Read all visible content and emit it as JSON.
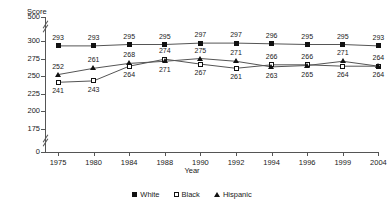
{
  "chart_data": {
    "type": "line",
    "title": "",
    "xlabel": "Year",
    "ylabel": "Score",
    "categories": [
      "1975",
      "1980",
      "1984",
      "1988",
      "1990",
      "1992",
      "1994",
      "1996",
      "1999",
      "2004"
    ],
    "series": [
      {
        "name": "White",
        "marker": "filled-square",
        "values": [
          293,
          293,
          295,
          295,
          297,
          297,
          296,
          295,
          295,
          293
        ]
      },
      {
        "name": "Black",
        "marker": "open-square",
        "values": [
          241,
          243,
          264,
          274,
          267,
          261,
          266,
          266,
          264,
          264
        ]
      },
      {
        "name": "Hispanic",
        "marker": "filled-triangle",
        "values": [
          252,
          261,
          268,
          271,
          275,
          271,
          263,
          265,
          271,
          264
        ]
      }
    ],
    "ylim": [
      175,
      300
    ],
    "yticks": [
      "500",
      "300",
      "275",
      "250",
      "225",
      "200",
      "175",
      "0"
    ],
    "axis_breaks": [
      "between-500-and-300",
      "between-175-and-0"
    ],
    "grid": false,
    "legend_position": "bottom-center",
    "line_color": "#555555",
    "marker_color": "#111111"
  },
  "legend": {
    "items": [
      {
        "label": "White"
      },
      {
        "label": "Black"
      },
      {
        "label": "Hispanic"
      }
    ]
  }
}
